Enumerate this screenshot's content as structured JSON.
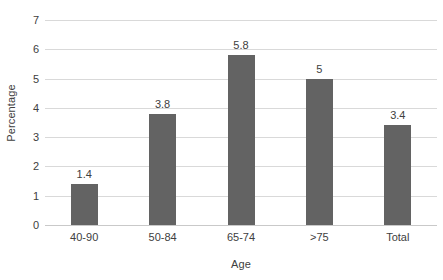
{
  "chart_data": {
    "type": "bar",
    "title": "",
    "xlabel": "Age",
    "ylabel": "Percentage",
    "categories": [
      "40-90",
      "50-84",
      "65-74",
      ">75",
      "Total"
    ],
    "values": [
      1.4,
      3.8,
      5.8,
      5,
      3.4
    ],
    "value_labels": [
      "1.4",
      "3.8",
      "5.8",
      "5",
      "3.4"
    ],
    "ylim": [
      0,
      7
    ],
    "yticks": [
      0,
      1,
      2,
      3,
      4,
      5,
      6,
      7
    ],
    "ytick_labels": [
      "0",
      "1",
      "2",
      "3",
      "4",
      "5",
      "6",
      "7"
    ],
    "grid": true,
    "legend": false,
    "series": [
      {
        "name": "Percentage",
        "color": "#636363",
        "values": [
          1.4,
          3.8,
          5.8,
          5,
          3.4
        ]
      }
    ],
    "colors": {
      "bar": "#636363",
      "gridline": "#d9d9d9",
      "text": "#404040",
      "background": "#ffffff"
    }
  }
}
